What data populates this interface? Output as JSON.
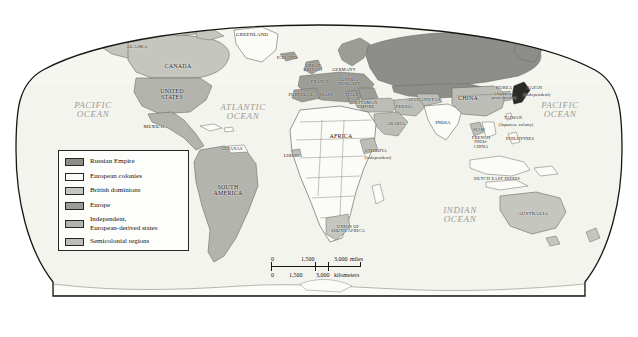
{
  "figure": {
    "type": "thematic-world-map",
    "projection": "oval-globe",
    "background_color": "#ffffff",
    "outline_color": "#1a1713"
  },
  "palette": {
    "russian_empire": "#8d8d8a",
    "european_colonies": "#fbfbf7",
    "british_dominions": "#c6c6c0",
    "europe": "#9d9d98",
    "independent_european_derived": "#b4b4ae",
    "semicolonial": "#bdbdb7",
    "ocean": "#f4f4ef",
    "border": "#6e6a62",
    "label_color": "#191510",
    "ocean_label_color": "#9a9a93"
  },
  "legend": {
    "items": [
      {
        "label": "Russian Empire",
        "swatch": "#8d8d8a",
        "lines": 1
      },
      {
        "label": "European colonies",
        "swatch": "#fbfbf7",
        "lines": 1
      },
      {
        "label": "British dominions",
        "swatch": "#c6c6c0",
        "lines": 1
      },
      {
        "label": "Europe",
        "swatch": "#9d9d98",
        "lines": 1
      },
      {
        "label": "Independent,\nEuropean-derived states",
        "swatch": "#b4b4ae",
        "lines": 2
      },
      {
        "label": "Semicolonial regions",
        "swatch": "#bdbdb7",
        "lines": 1
      }
    ]
  },
  "scale_bar": {
    "miles": {
      "ticks": [
        "0",
        "1,500",
        "3,000"
      ],
      "unit_label": "miles"
    },
    "kilometers": {
      "ticks": [
        "0",
        "1,500",
        "3,000"
      ],
      "unit_label": "kilometers"
    }
  },
  "ocean_labels": [
    {
      "name": "PACIFIC\nOCEAN",
      "x": 93,
      "y": 110
    },
    {
      "name": "ATLANTIC\nOCEAN",
      "x": 243,
      "y": 112
    },
    {
      "name": "PACIFIC\nOCEAN",
      "x": 560,
      "y": 110
    },
    {
      "name": "INDIAN\nOCEAN",
      "x": 460,
      "y": 215
    }
  ],
  "map_labels": [
    {
      "name": "ALASKA",
      "x": 137,
      "y": 46,
      "size": "small",
      "category": "british_dominions"
    },
    {
      "name": "CANADA",
      "x": 178,
      "y": 66,
      "size": "country",
      "category": "british_dominions"
    },
    {
      "name": "UNITED\nSTATES",
      "x": 172,
      "y": 94,
      "size": "country",
      "category": "independent_european_derived"
    },
    {
      "name": "MEXICO",
      "x": 154,
      "y": 126,
      "size": "small",
      "category": "independent_european_derived"
    },
    {
      "name": "GREENLAND",
      "x": 252,
      "y": 34,
      "size": "small",
      "category": "european_colonies"
    },
    {
      "name": "ICELAND",
      "x": 287,
      "y": 58,
      "size": "tiny",
      "category": "europe"
    },
    {
      "name": "GREAT\nBRITAIN",
      "x": 313,
      "y": 68,
      "size": "tiny",
      "category": "europe"
    },
    {
      "name": "GERMANY",
      "x": 344,
      "y": 70,
      "size": "tiny",
      "category": "europe"
    },
    {
      "name": "AUSTRIA-\nHUNGARY",
      "x": 349,
      "y": 82,
      "size": "tiny",
      "category": "europe"
    },
    {
      "name": "FRANCE",
      "x": 320,
      "y": 82,
      "size": "tiny",
      "category": "europe"
    },
    {
      "name": "PORTUGAL",
      "x": 301,
      "y": 95,
      "size": "tiny",
      "category": "europe"
    },
    {
      "name": "SPAIN",
      "x": 326,
      "y": 95,
      "size": "tiny",
      "category": "europe"
    },
    {
      "name": "ITALY",
      "x": 352,
      "y": 95,
      "size": "tiny",
      "category": "europe"
    },
    {
      "name": "OTTOMAN\nEMPIRE",
      "x": 366,
      "y": 105,
      "size": "tiny",
      "category": "semicolonial"
    },
    {
      "name": "AFGHANISTAN",
      "x": 424,
      "y": 100,
      "size": "tiny",
      "category": "semicolonial"
    },
    {
      "name": "PERSIA",
      "x": 404,
      "y": 107,
      "size": "tiny",
      "category": "semicolonial"
    },
    {
      "name": "ARABIA",
      "x": 396,
      "y": 124,
      "size": "tiny",
      "category": "semicolonial"
    },
    {
      "name": "INDIA",
      "x": 443,
      "y": 122,
      "size": "small",
      "category": "european_colonies"
    },
    {
      "name": "CHINA",
      "x": 468,
      "y": 98,
      "size": "country",
      "category": "semicolonial"
    },
    {
      "name": "KOREA",
      "x": 504,
      "y": 88,
      "size": "tiny",
      "category": "semicolonial"
    },
    {
      "name": "(Japanese\nprotectorate)",
      "x": 504,
      "y": 96,
      "size": "tiny",
      "category": "annotation"
    },
    {
      "name": "JAPAN",
      "x": 535,
      "y": 88,
      "size": "tiny",
      "category": "independent_european_derived"
    },
    {
      "name": "(independent)",
      "x": 537,
      "y": 95,
      "size": "tiny",
      "category": "annotation"
    },
    {
      "name": "TAIWAN",
      "x": 513,
      "y": 118,
      "size": "tiny",
      "category": "european_colonies"
    },
    {
      "name": "(Japanese colony)",
      "x": 516,
      "y": 125,
      "size": "tiny",
      "category": "annotation"
    },
    {
      "name": "PHILIPPINES",
      "x": 520,
      "y": 139,
      "size": "tiny",
      "category": "european_colonies"
    },
    {
      "name": "SIAM",
      "x": 479,
      "y": 130,
      "size": "tiny",
      "category": "semicolonial"
    },
    {
      "name": "FRENCH\nINDO-\nCHINA",
      "x": 481,
      "y": 143,
      "size": "tiny",
      "category": "european_colonies"
    },
    {
      "name": "DUTCH EAST INDIES",
      "x": 497,
      "y": 179,
      "size": "tiny",
      "category": "european_colonies"
    },
    {
      "name": "AUSTRALIA",
      "x": 533,
      "y": 213,
      "size": "small",
      "category": "british_dominions"
    },
    {
      "name": "AFRICA",
      "x": 341,
      "y": 136,
      "size": "country",
      "category": "european_colonies"
    },
    {
      "name": "ETHIOPIA",
      "x": 376,
      "y": 151,
      "size": "tiny",
      "category": "semicolonial"
    },
    {
      "name": "(independent)",
      "x": 378,
      "y": 158,
      "size": "tiny",
      "category": "annotation"
    },
    {
      "name": "LIBERIA",
      "x": 293,
      "y": 156,
      "size": "tiny",
      "category": "semicolonial"
    },
    {
      "name": "UNION OF\nSOUTH AFRICA",
      "x": 348,
      "y": 229,
      "size": "tiny",
      "category": "british_dominions"
    },
    {
      "name": "GUIANAS",
      "x": 232,
      "y": 149,
      "size": "tiny",
      "category": "european_colonies"
    },
    {
      "name": "SOUTH\nAMERICA",
      "x": 228,
      "y": 190,
      "size": "country",
      "category": "independent_european_derived"
    }
  ]
}
